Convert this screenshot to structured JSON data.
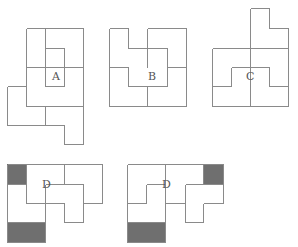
{
  "colors": {
    "line": "#8a8a8a",
    "shade": "#6f6f6f",
    "label": "#555555"
  },
  "figures": [
    {
      "id": "A",
      "label": "A",
      "label_pos": [
        52,
        80
      ],
      "segments": [
        [
          26,
          28,
          83,
          28
        ],
        [
          26,
          28,
          26,
          106
        ],
        [
          83,
          28,
          83,
          144
        ],
        [
          45,
          28,
          45,
          67
        ],
        [
          45,
          48,
          64,
          48
        ],
        [
          64,
          48,
          64,
          86
        ],
        [
          26,
          67,
          83,
          67
        ],
        [
          45,
          67,
          45,
          86
        ],
        [
          45,
          86,
          64,
          86
        ],
        [
          26,
          106,
          83,
          106
        ],
        [
          7,
          86,
          26,
          86
        ],
        [
          7,
          86,
          7,
          125
        ],
        [
          7,
          125,
          64,
          125
        ],
        [
          45,
          106,
          45,
          125
        ],
        [
          64,
          125,
          64,
          144
        ],
        [
          64,
          144,
          83,
          144
        ]
      ],
      "shaded": []
    },
    {
      "id": "B",
      "label": "B",
      "label_pos": [
        148,
        80
      ],
      "segments": [
        [
          109,
          28,
          128,
          28
        ],
        [
          147,
          28,
          186,
          28
        ],
        [
          109,
          28,
          109,
          106
        ],
        [
          186,
          28,
          186,
          106
        ],
        [
          109,
          106,
          186,
          106
        ],
        [
          128,
          28,
          128,
          48
        ],
        [
          128,
          48,
          167,
          48
        ],
        [
          147,
          28,
          147,
          67
        ],
        [
          167,
          48,
          167,
          86
        ],
        [
          109,
          67,
          128,
          67
        ],
        [
          128,
          67,
          128,
          86
        ],
        [
          128,
          86,
          167,
          86
        ],
        [
          147,
          86,
          147,
          106
        ],
        [
          167,
          67,
          186,
          67
        ]
      ],
      "shaded": []
    },
    {
      "id": "C",
      "label": "C",
      "label_pos": [
        246,
        80
      ],
      "segments": [
        [
          250,
          8,
          269,
          8
        ],
        [
          250,
          8,
          250,
          106
        ],
        [
          269,
          8,
          269,
          28
        ],
        [
          269,
          28,
          288,
          28
        ],
        [
          288,
          28,
          288,
          106
        ],
        [
          212,
          48,
          288,
          48
        ],
        [
          212,
          48,
          212,
          106
        ],
        [
          212,
          106,
          288,
          106
        ],
        [
          231,
          67,
          269,
          67
        ],
        [
          231,
          67,
          231,
          86
        ],
        [
          212,
          86,
          231,
          86
        ],
        [
          269,
          67,
          269,
          86
        ],
        [
          269,
          86,
          288,
          86
        ]
      ],
      "shaded": []
    },
    {
      "id": "D1",
      "label": "D",
      "label_pos": [
        42,
        188
      ],
      "segments": [
        [
          7,
          164,
          102,
          164
        ],
        [
          7,
          164,
          7,
          242
        ],
        [
          7,
          242,
          45,
          242
        ],
        [
          45,
          184,
          45,
          242
        ],
        [
          26,
          164,
          26,
          203
        ],
        [
          26,
          203,
          64,
          203
        ],
        [
          64,
          203,
          64,
          222
        ],
        [
          64,
          222,
          83,
          222
        ],
        [
          83,
          184,
          83,
          222
        ],
        [
          45,
          184,
          83,
          184
        ],
        [
          64,
          164,
          64,
          184
        ],
        [
          102,
          164,
          102,
          203
        ],
        [
          83,
          203,
          102,
          203
        ],
        [
          7,
          184,
          26,
          184
        ],
        [
          7,
          222,
          45,
          222
        ]
      ],
      "shaded": [
        [
          7,
          164,
          19,
          20
        ],
        [
          7,
          222,
          38,
          20
        ]
      ]
    },
    {
      "id": "D2",
      "label": "D",
      "label_pos": [
        162,
        188
      ],
      "segments": [
        [
          127,
          164,
          223,
          164
        ],
        [
          127,
          164,
          127,
          242
        ],
        [
          127,
          242,
          165,
          242
        ],
        [
          165,
          164,
          165,
          242
        ],
        [
          127,
          203,
          146,
          203
        ],
        [
          146,
          184,
          146,
          203
        ],
        [
          146,
          184,
          165,
          184
        ],
        [
          165,
          203,
          185,
          203
        ],
        [
          185,
          184,
          185,
          222
        ],
        [
          185,
          184,
          223,
          184
        ],
        [
          185,
          222,
          203,
          222
        ],
        [
          203,
          203,
          203,
          222
        ],
        [
          203,
          203,
          223,
          203
        ],
        [
          223,
          164,
          223,
          203
        ],
        [
          203,
          164,
          203,
          184
        ],
        [
          127,
          222,
          165,
          222
        ]
      ],
      "shaded": [
        [
          203,
          164,
          20,
          20
        ],
        [
          127,
          222,
          38,
          20
        ]
      ]
    }
  ]
}
